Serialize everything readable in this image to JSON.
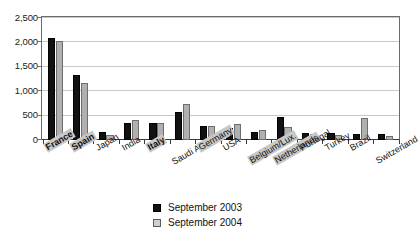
{
  "chart_data": {
    "type": "bar",
    "title": "",
    "subtitle": "",
    "xlabel": "",
    "ylabel": "",
    "ylim": [
      0,
      2500
    ],
    "ytick_step": 500,
    "ytick_labels": [
      "2,500",
      "2,000",
      "1,500",
      "1,000",
      "500",
      "0"
    ],
    "ytick_values": [
      2500,
      2000,
      1500,
      1000,
      500,
      0
    ],
    "grid": true,
    "grid_axis": "y",
    "legend_position": "bottom-center",
    "categories": [
      "France",
      "Spain",
      "Japan",
      "India",
      "Italy",
      "Saudi Arabia",
      "Germany",
      "USA",
      "Belgium/Lux.",
      "Netherlands",
      "Portugal",
      "Turkey",
      "Brazil",
      "Switzerland"
    ],
    "category_styles": [
      {
        "bold": true,
        "highlight": true
      },
      {
        "bold": true,
        "highlight": true
      },
      {
        "bold": false,
        "highlight": false
      },
      {
        "bold": false,
        "highlight": false
      },
      {
        "bold": true,
        "highlight": true
      },
      {
        "bold": false,
        "highlight": false
      },
      {
        "bold": false,
        "highlight": true
      },
      {
        "bold": false,
        "highlight": false
      },
      {
        "bold": false,
        "highlight": true
      },
      {
        "bold": false,
        "highlight": true
      },
      {
        "bold": false,
        "highlight": false
      },
      {
        "bold": false,
        "highlight": false
      },
      {
        "bold": false,
        "highlight": false
      },
      {
        "bold": false,
        "highlight": false
      }
    ],
    "series": [
      {
        "name": "September 2003",
        "color": "#111111",
        "values": [
          2080,
          1320,
          150,
          330,
          340,
          560,
          280,
          230,
          150,
          460,
          130,
          140,
          120,
          110
        ]
      },
      {
        "name": "September 2004",
        "color": "#b0b0b0",
        "values": [
          2010,
          1150,
          100,
          400,
          340,
          720,
          270,
          310,
          190,
          250,
          120,
          100,
          440,
          70
        ]
      }
    ]
  },
  "legend": {
    "items": [
      {
        "label": "September 2003",
        "color": "#111111"
      },
      {
        "label": "September 2004",
        "color": "#cfcfcf"
      }
    ]
  }
}
